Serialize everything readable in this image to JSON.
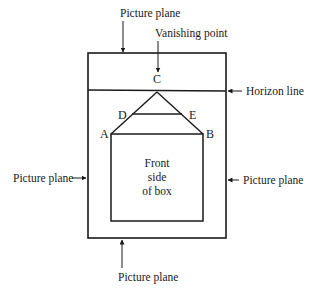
{
  "diagram": {
    "labels": {
      "picture_plane_top": "Picture plane",
      "vanishing_point": "Vanishing point",
      "horizon_line": "Horizon line",
      "picture_plane_left": "Picture plane",
      "picture_plane_right": "Picture plane",
      "picture_plane_bottom": "Picture plane"
    },
    "points": {
      "A": "A",
      "B": "B",
      "C": "C",
      "D": "D",
      "E": "E"
    },
    "box_text": [
      "Front",
      "side",
      "of box"
    ],
    "colors": {
      "line": "#1a1a1a",
      "background": "#ffffff"
    }
  }
}
